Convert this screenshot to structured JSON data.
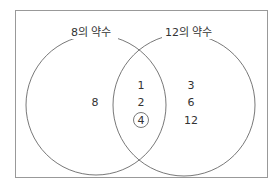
{
  "diagram": {
    "type": "venn",
    "sets": [
      {
        "label": "8의 약수",
        "only": [
          "8"
        ]
      },
      {
        "label": "12의 약수",
        "only": [
          "3",
          "6",
          "12"
        ]
      }
    ],
    "intersection": [
      "1",
      "2",
      "4"
    ],
    "circled": "4"
  }
}
